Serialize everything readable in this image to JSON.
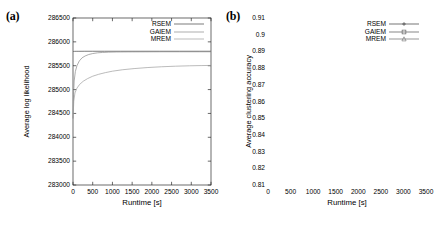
{
  "figure": {
    "panels": [
      {
        "label": "(a)",
        "name": "panel-a"
      },
      {
        "label": "(b)",
        "name": "panel-b"
      }
    ]
  },
  "chart_data": [
    {
      "type": "line",
      "panel": "(a)",
      "title": "",
      "xlabel": "Runtime [s]",
      "ylabel": "Average log likelihood",
      "xlim": [
        0,
        3500
      ],
      "ylim": [
        283000,
        286500
      ],
      "xticks": [
        0,
        500,
        1000,
        1500,
        2000,
        2500,
        3000,
        3500
      ],
      "yticks": [
        283000,
        283500,
        284000,
        284500,
        285000,
        285500,
        286000,
        286500
      ],
      "xtick_labels": [
        "0",
        "500",
        "1000",
        "1500",
        "2000",
        "2500",
        "3000",
        "3500"
      ],
      "ytick_labels": [
        "283000",
        "283500",
        "284000",
        "284500",
        "285000",
        "285500",
        "286000",
        "286500"
      ],
      "grid": false,
      "legend_position": "top-right",
      "markers": false,
      "series": [
        {
          "name": "RSEM",
          "marker": "none",
          "color": "#444444",
          "x": [
            0,
            10,
            20,
            40,
            80,
            150,
            300,
            500,
            800,
            1200,
            1700,
            2200,
            2700,
            3200,
            3500
          ],
          "values": [
            285790,
            285797,
            285800,
            285801,
            285802,
            285802,
            285803,
            285803,
            285803,
            285803,
            285803,
            285803,
            285803,
            285803,
            285803
          ]
        },
        {
          "name": "GAIEM",
          "marker": "none",
          "color": "#8a8a8a",
          "x": [
            0,
            15,
            30,
            60,
            100,
            160,
            230,
            310,
            400,
            500,
            620,
            750,
            900,
            1100,
            1400,
            1800,
            2300,
            2800,
            3200,
            3500
          ],
          "values": [
            284400,
            284900,
            285180,
            285380,
            285500,
            285600,
            285665,
            285705,
            285735,
            285755,
            285770,
            285778,
            285784,
            285788,
            285790,
            285791,
            285792,
            285792,
            285792,
            285792
          ]
        },
        {
          "name": "MREM",
          "marker": "none",
          "color": "#9e9e9e",
          "x": [
            0,
            20,
            50,
            100,
            170,
            260,
            370,
            500,
            650,
            820,
            1000,
            1250,
            1550,
            1900,
            2250,
            2600,
            2950,
            3250,
            3500
          ],
          "values": [
            284380,
            284760,
            284930,
            285030,
            285110,
            285175,
            285230,
            285280,
            285320,
            285355,
            285385,
            285415,
            285440,
            285462,
            285478,
            285490,
            285498,
            285503,
            285506
          ]
        }
      ]
    },
    {
      "type": "line",
      "panel": "(b)",
      "title": "",
      "xlabel": "Runtime [s]",
      "ylabel": "Average clustering accuracy",
      "xlim": [
        0,
        3500
      ],
      "ylim": [
        0.81,
        0.91
      ],
      "xticks": [
        0,
        500,
        1000,
        1500,
        2000,
        2500,
        3000,
        3500
      ],
      "yticks": [
        0.81,
        0.82,
        0.83,
        0.84,
        0.85,
        0.86,
        0.87,
        0.88,
        0.89,
        0.9,
        0.91
      ],
      "xtick_labels": [
        "0",
        "500",
        "1000",
        "1500",
        "2000",
        "2500",
        "3000",
        "3500"
      ],
      "ytick_labels": [
        "0.81",
        "0.82",
        "0.83",
        "0.84",
        "0.85",
        "0.86",
        "0.87",
        "0.88",
        "0.89",
        "0.9",
        "0.91"
      ],
      "grid": false,
      "legend_position": "top-right",
      "markers": true,
      "series": [
        {
          "name": "RSEM",
          "marker": "plus",
          "color": "#3a3a3a",
          "x": [
            60,
            130,
            200,
            270,
            340,
            410,
            480,
            550,
            620,
            690,
            760,
            830,
            900,
            970,
            1040,
            1110,
            1180,
            1250,
            1320,
            1390,
            1460,
            1530,
            1600,
            1670,
            1740,
            1810,
            1880,
            1950,
            2020,
            2090,
            2160,
            2230,
            2300,
            2370,
            2440,
            2510,
            2580,
            2650,
            2720,
            2790,
            2860,
            2930,
            3000,
            3070,
            3140,
            3210,
            3280,
            3350,
            3420,
            3490
          ],
          "values": [
            0.8855,
            0.8838,
            0.8825,
            0.8816,
            0.8812,
            0.881,
            0.8809,
            0.8808,
            0.8807,
            0.8806,
            0.8806,
            0.8805,
            0.8805,
            0.8805,
            0.8804,
            0.8804,
            0.8804,
            0.8804,
            0.8804,
            0.8804,
            0.8804,
            0.8803,
            0.8803,
            0.8803,
            0.8803,
            0.8803,
            0.8803,
            0.8803,
            0.8803,
            0.8803,
            0.8803,
            0.8803,
            0.8803,
            0.8803,
            0.8803,
            0.8803,
            0.8803,
            0.8803,
            0.8803,
            0.8803,
            0.8803,
            0.8803,
            0.8803,
            0.8803,
            0.8803,
            0.8803,
            0.8803,
            0.8803,
            0.8803,
            0.8803
          ]
        },
        {
          "name": "GAIEM",
          "marker": "square",
          "color": "#555555",
          "x": [
            60,
            130,
            200,
            270,
            340,
            410,
            480,
            550,
            620,
            690,
            760,
            830,
            900,
            970,
            1040,
            1110,
            1180,
            1250,
            1320,
            1390,
            1460,
            1530,
            1600,
            1670,
            1740,
            1810,
            1880,
            1950,
            2020,
            2090,
            2160,
            2230,
            2300,
            2370,
            2440,
            2510,
            2580,
            2650,
            2720,
            2790,
            2860,
            2930,
            3000,
            3070,
            3140,
            3210,
            3280,
            3350,
            3420,
            3490
          ],
          "values": [
            0.8412,
            0.864,
            0.8665,
            0.872,
            0.8758,
            0.8782,
            0.8798,
            0.8808,
            0.8812,
            0.8822,
            0.8838,
            0.8852,
            0.8862,
            0.887,
            0.8876,
            0.888,
            0.8883,
            0.8885,
            0.8886,
            0.8887,
            0.8888,
            0.8889,
            0.889,
            0.889,
            0.8891,
            0.8891,
            0.8892,
            0.8892,
            0.8893,
            0.8893,
            0.8894,
            0.8894,
            0.8895,
            0.8895,
            0.8896,
            0.8896,
            0.8897,
            0.8897,
            0.8898,
            0.8898,
            0.8899,
            0.8899,
            0.89,
            0.89,
            0.8901,
            0.8901,
            0.8902,
            0.8903,
            0.8905,
            0.8912
          ]
        },
        {
          "name": "MREM",
          "marker": "triangle",
          "color": "#6b6b6b",
          "x": [
            60,
            130,
            200,
            270,
            340,
            410,
            480,
            550,
            620,
            690,
            760,
            830,
            900,
            970,
            1040,
            1110,
            1180,
            1250,
            1320,
            1390,
            1460,
            1530,
            1600,
            1670,
            1740,
            1810,
            1880,
            1950,
            2020,
            2090,
            2160,
            2230,
            2300,
            2370,
            2440,
            2510,
            2580,
            2650,
            2720,
            2790,
            2860,
            2930,
            3000,
            3070,
            3140,
            3210,
            3280,
            3350,
            3420,
            3490
          ],
          "values": [
            0.816,
            0.8242,
            0.8308,
            0.833,
            0.834,
            0.8348,
            0.8352,
            0.8358,
            0.8364,
            0.8372,
            0.8384,
            0.8398,
            0.8408,
            0.8418,
            0.8432,
            0.8448,
            0.8468,
            0.8486,
            0.8496,
            0.85,
            0.8502,
            0.8504,
            0.8504,
            0.8502,
            0.8506,
            0.8508,
            0.8508,
            0.851,
            0.8512,
            0.8514,
            0.8518,
            0.8522,
            0.8524,
            0.8526,
            0.8528,
            0.853,
            0.8534,
            0.8538,
            0.854,
            0.8544,
            0.8548,
            0.8552,
            0.8554,
            0.855,
            0.8548,
            0.855,
            0.8552,
            0.8554,
            0.8552,
            0.8556
          ]
        }
      ]
    }
  ]
}
